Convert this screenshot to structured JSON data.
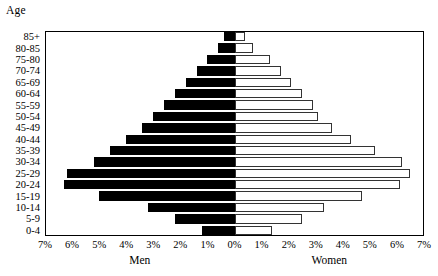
{
  "labels": {
    "age_caption": "Age",
    "men_caption": "Men",
    "women_caption": "Women"
  },
  "chart_data": {
    "type": "bar",
    "subtype": "population-pyramid",
    "title": "",
    "xlabel": "",
    "ylabel": "Age",
    "grid": false,
    "legend": "none",
    "orientation": "horizontal",
    "axis_unit": "%",
    "xlim": [
      -7,
      7
    ],
    "xticks": [
      -7,
      -6,
      -5,
      -4,
      -3,
      -2,
      -1,
      0,
      1,
      2,
      3,
      4,
      5,
      6,
      7
    ],
    "xtick_labels": [
      "7%",
      "6%",
      "5%",
      "4%",
      "3%",
      "2%",
      "1%",
      "0%",
      "1%",
      "2%",
      "3%",
      "4%",
      "5%",
      "6%",
      "7%"
    ],
    "categories": [
      "85+",
      "80-85",
      "75-80",
      "70-74",
      "65-69",
      "60-64",
      "55-59",
      "50-54",
      "45-49",
      "40-44",
      "35-39",
      "30-34",
      "25-29",
      "20-24",
      "15-19",
      "10-14",
      "5-9",
      "0-4"
    ],
    "series": [
      {
        "name": "Men",
        "color": "#000000",
        "values": [
          0.4,
          0.6,
          1.0,
          1.4,
          1.8,
          2.2,
          2.6,
          3.0,
          3.4,
          4.0,
          4.6,
          5.2,
          6.2,
          6.3,
          5.0,
          3.2,
          2.2,
          1.2
        ]
      },
      {
        "name": "Women",
        "color": "#ffffff",
        "values": [
          0.4,
          0.7,
          1.3,
          1.7,
          2.1,
          2.5,
          2.9,
          3.1,
          3.6,
          4.3,
          5.2,
          6.2,
          6.5,
          6.1,
          4.7,
          3.3,
          2.5,
          1.4
        ]
      }
    ]
  }
}
